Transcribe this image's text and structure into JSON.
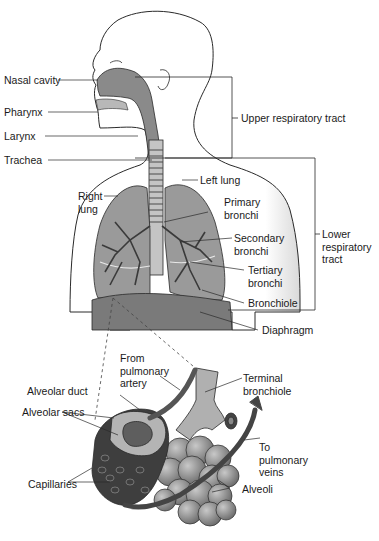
{
  "diagram": {
    "labels": {
      "nasal_cavity": "Nasal cavity",
      "pharynx": "Pharynx",
      "larynx": "Larynx",
      "trachea": "Trachea",
      "upper_tract": "Upper respiratory tract",
      "left_lung": "Left lung",
      "right_lung": "Right\nlung",
      "primary_bronchi": "Primary\nbronchi",
      "secondary_bronchi": "Secondary\nbronchi",
      "tertiary_bronchi": "Tertiary\nbronchi",
      "bronchiole": "Bronchiole",
      "lower_tract": "Lower\nrespiratory\ntract",
      "diaphragm": "Diaphragm",
      "from_pulmonary_artery": "From\npulmonary\nartery",
      "terminal_bronchiole": "Terminal\nbronchiole",
      "alveolar_duct": "Alveolar duct",
      "alveolar_sacs": "Alveolar sacs",
      "to_pulmonary_veins": "To\npulmonary\nveins",
      "capillaries": "Capillaries",
      "alveoli": "Alveoli"
    },
    "colors": {
      "outline": "#2a2a2a",
      "airway": "#7a7a7a",
      "lung": "#9a9a9a",
      "diaphragm": "#6e6e6e",
      "alveoli": "#8c8c8c",
      "vessel": "#555555"
    }
  }
}
